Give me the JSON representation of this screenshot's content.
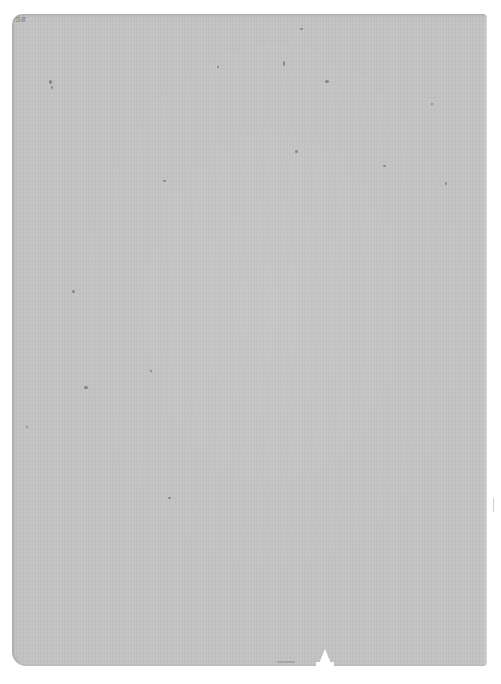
{
  "document": {
    "type": "scanned blank page",
    "page_number_mark": "58",
    "content_text": "",
    "paper_color": "#c4c4c4",
    "background_color": "#ffffff"
  },
  "specks": [
    {
      "x": 49,
      "y": 80,
      "w": 3,
      "h": 4
    },
    {
      "x": 51,
      "y": 86,
      "w": 2,
      "h": 3
    },
    {
      "x": 217,
      "y": 66,
      "w": 2,
      "h": 2
    },
    {
      "x": 283,
      "y": 61,
      "w": 2,
      "h": 5
    },
    {
      "x": 325,
      "y": 80,
      "w": 4,
      "h": 3
    },
    {
      "x": 300,
      "y": 28,
      "w": 3,
      "h": 2
    },
    {
      "x": 163,
      "y": 180,
      "w": 3,
      "h": 2
    },
    {
      "x": 383,
      "y": 165,
      "w": 3,
      "h": 2
    },
    {
      "x": 445,
      "y": 182,
      "w": 2,
      "h": 3
    },
    {
      "x": 72,
      "y": 290,
      "w": 3,
      "h": 3
    },
    {
      "x": 84,
      "y": 386,
      "w": 4,
      "h": 3
    },
    {
      "x": 26,
      "y": 426,
      "w": 2,
      "h": 2
    },
    {
      "x": 168,
      "y": 497,
      "w": 3,
      "h": 2
    },
    {
      "x": 150,
      "y": 370,
      "w": 2,
      "h": 2
    },
    {
      "x": 431,
      "y": 103,
      "w": 2,
      "h": 2
    },
    {
      "x": 295,
      "y": 150,
      "w": 3,
      "h": 3
    }
  ]
}
